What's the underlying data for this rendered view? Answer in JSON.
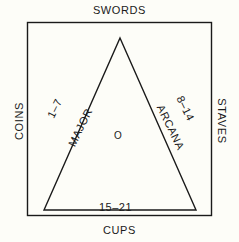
{
  "diagram": {
    "background_color": "#fdfdf8",
    "line_color": "#1a1a1a",
    "outer_labels": {
      "top": "SWORDS",
      "left": "COINS",
      "right": "STAVES",
      "bottom": "CUPS"
    },
    "triangle_labels": {
      "left_range": "1–7",
      "left_word": "MAJOR",
      "right_word": "ARCANA",
      "right_range": "8–14",
      "bottom_range": "15–21",
      "center": "O"
    }
  }
}
